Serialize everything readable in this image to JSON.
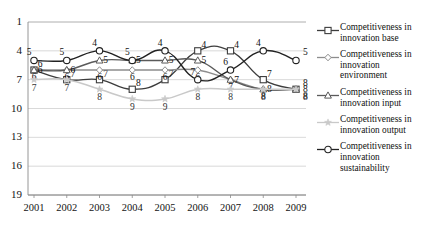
{
  "chart_data": {
    "type": "line",
    "title": "",
    "xlabel": "",
    "ylabel": "",
    "categories": [
      "2001",
      "2002",
      "2003",
      "2004",
      "2005",
      "2006",
      "2007",
      "2008",
      "2009"
    ],
    "ylim": [
      1,
      19
    ],
    "y_inverted": true,
    "yticks": [
      1,
      4,
      7,
      10,
      13,
      16,
      19
    ],
    "grid": true,
    "legend_position": "right",
    "series": [
      {
        "name": "Competitiveness in innovation base",
        "marker": "square",
        "color": "#3d3d3d",
        "values": [
          6,
          7,
          7,
          8,
          7,
          4,
          4,
          7,
          8
        ],
        "labels": [
          "6",
          "7",
          "7",
          "8",
          "7",
          "4",
          "4",
          "7",
          "8"
        ]
      },
      {
        "name": "Competitiveness in innovation environment",
        "marker": "diamond",
        "color": "#8d8d8d",
        "values": [
          6,
          6,
          6,
          6,
          6,
          6,
          7,
          8,
          8
        ],
        "labels": [
          "6",
          "6",
          "6",
          "6",
          "6",
          "6",
          "7",
          "8",
          "8"
        ]
      },
      {
        "name": "Competitiveness in innovation input",
        "marker": "triangle",
        "color": "#5a5a5a",
        "values": [
          6,
          6,
          5,
          5,
          5,
          5,
          7,
          8,
          8
        ],
        "labels": [
          "6",
          "6",
          "5",
          "5",
          "5",
          "5",
          "7",
          "8",
          "8"
        ]
      },
      {
        "name": "Competitiveness in innovation output",
        "marker": "star",
        "color": "#c9c9c9",
        "values": [
          7,
          7,
          8,
          9,
          9,
          8,
          8,
          8,
          8
        ],
        "labels": [
          "7",
          "7",
          "8",
          "9",
          "9",
          "8",
          "8",
          "8",
          "8"
        ]
      },
      {
        "name": "Competitiveness in innovation sustainability",
        "marker": "circle",
        "color": "#222222",
        "values": [
          5,
          5,
          4,
          5,
          4,
          7,
          6,
          4,
          5
        ],
        "labels": [
          "5",
          "5",
          "4",
          "5",
          "4",
          "7",
          "6",
          "4",
          "5"
        ]
      }
    ]
  },
  "legend": {
    "items": [
      {
        "label": "Competitiveness in innovation base"
      },
      {
        "label": "Competitiveness in innovation environment"
      },
      {
        "label": "Competitiveness in innovation input"
      },
      {
        "label": "Competitiveness in innovation output"
      },
      {
        "label": "Competitiveness in innovation sustainability"
      }
    ]
  },
  "axes": {
    "y_tick_labels": [
      "1",
      "4",
      "7",
      "10",
      "13",
      "16",
      "19"
    ],
    "x_tick_labels": [
      "2001",
      "2002",
      "2003",
      "2004",
      "2005",
      "2006",
      "2007",
      "2008",
      "2009"
    ]
  }
}
